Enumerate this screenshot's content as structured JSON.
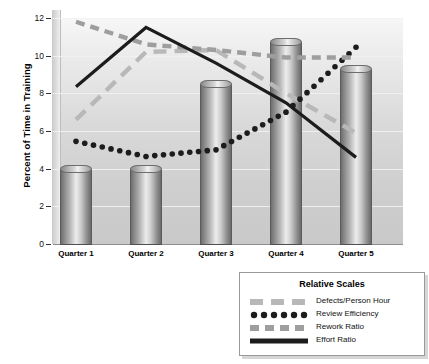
{
  "chart_data": {
    "type": "bar",
    "title": "",
    "xlabel": "",
    "ylabel": "Percent of Time in Training",
    "categories": [
      "Quarter 1",
      "Quarter 2",
      "Quarter 3",
      "Quarter 4",
      "Quarter 5"
    ],
    "ylim": [
      0,
      12
    ],
    "yticks": [
      0,
      2,
      4,
      6,
      8,
      10,
      12
    ],
    "grid": true,
    "legend_position": "bottom-right",
    "legend_title": "Relative Scales",
    "bars": {
      "name": "Percent of Time in Training",
      "values": [
        4.0,
        4.0,
        8.5,
        10.7,
        9.3
      ]
    },
    "series": [
      {
        "name": "Defects/Person Hour",
        "type": "line",
        "style": "long-dash",
        "color": "#b8b8b8",
        "values": [
          6.6,
          10.2,
          10.3,
          8.0,
          5.9
        ]
      },
      {
        "name": "Review Efficiency",
        "type": "line",
        "style": "dotted",
        "color": "#1c1c1c",
        "values": [
          5.45,
          4.65,
          5.0,
          7.0,
          10.45
        ]
      },
      {
        "name": "Rework Ratio",
        "type": "line",
        "style": "dash",
        "color": "#9e9e9e",
        "values": [
          11.8,
          10.6,
          10.3,
          9.9,
          9.9
        ]
      },
      {
        "name": "Effort Ratio",
        "type": "line",
        "style": "solid",
        "color": "#1c1c1c",
        "values": [
          8.35,
          11.5,
          9.6,
          7.5,
          4.6
        ]
      }
    ]
  },
  "axis": {
    "y_title": "Percent of Time in Training",
    "y_tick_labels": [
      "12",
      "10",
      "8",
      "6",
      "4",
      "2",
      "0"
    ],
    "x_tick_labels": [
      "Quarter 1",
      "Quarter 2",
      "Quarter 3",
      "Quarter 4",
      "Quarter 5"
    ]
  },
  "legend": {
    "title": "Relative Scales",
    "items": [
      {
        "label": "Defects/Person Hour"
      },
      {
        "label": "Review Efficiency"
      },
      {
        "label": "Rework Ratio"
      },
      {
        "label": "Effort Ratio"
      }
    ]
  }
}
